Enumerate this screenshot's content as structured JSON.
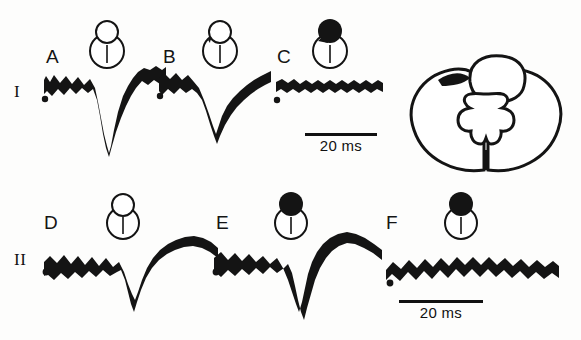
{
  "figure": {
    "rows": [
      {
        "id": "row-I",
        "label": "I"
      },
      {
        "id": "row-II",
        "label": "II"
      }
    ],
    "panels": [
      {
        "letter": "A",
        "row": "I",
        "lesion_icon": {
          "name": "lesion-icon-intact",
          "dorsal_fill": "none",
          "column_fill": "none"
        },
        "response": "large-negative-deflection",
        "stimulus_marker": true
      },
      {
        "letter": "B",
        "row": "I",
        "lesion_icon": {
          "name": "lesion-icon-partial-wedge",
          "dorsal_fill": "wedge",
          "column_fill": "none"
        },
        "response": "reduced-negative-deflection",
        "stimulus_marker": true
      },
      {
        "letter": "C",
        "row": "I",
        "lesion_icon": {
          "name": "lesion-icon-dorsal-filled",
          "dorsal_fill": "full",
          "column_fill": "none"
        },
        "response": "abolished-flat-trace",
        "stimulus_marker": true
      },
      {
        "letter": "D",
        "row": "II",
        "lesion_icon": {
          "name": "lesion-icon-intact",
          "dorsal_fill": "none",
          "column_fill": "none"
        },
        "response": "biphasic-with-late-positivity",
        "stimulus_marker": true
      },
      {
        "letter": "E",
        "row": "II",
        "lesion_icon": {
          "name": "lesion-icon-dorsal-filled",
          "dorsal_fill": "full",
          "column_fill": "none"
        },
        "response": "deep-negative-with-late-wave",
        "stimulus_marker": true
      },
      {
        "letter": "F",
        "row": "II",
        "lesion_icon": {
          "name": "lesion-icon-dorsal-filled",
          "dorsal_fill": "full",
          "column_fill": "none"
        },
        "response": "flat-noisy-baseline",
        "stimulus_marker": true
      }
    ],
    "scalebars": [
      {
        "id": "scalebar-top",
        "label": "20 ms"
      },
      {
        "id": "scalebar-bottom",
        "label": "20 ms"
      }
    ],
    "cord_diagram": {
      "name": "spinal-cord-cross-section",
      "features": [
        "dorsal-column-outline",
        "butterfly-gray-matter",
        "ventral-median-fissure",
        "dorsal-left-lesion-shading"
      ]
    },
    "colors": {
      "ink": "#111111",
      "paper": "#fdfdfc"
    }
  }
}
